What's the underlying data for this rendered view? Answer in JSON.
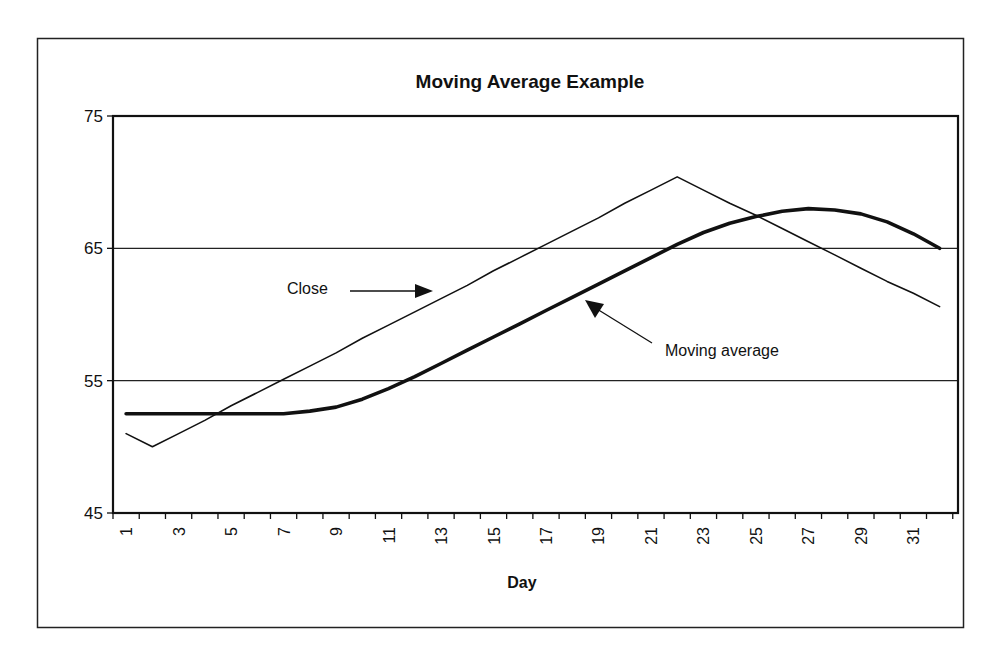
{
  "chart_data": {
    "type": "line",
    "title": "Moving Average Example",
    "xlabel": "Day",
    "ylabel": "",
    "ylim": [
      45,
      75
    ],
    "yticks": [
      45,
      55,
      65,
      75
    ],
    "xlim": [
      1,
      32
    ],
    "xtick_labels": [
      "1",
      "3",
      "5",
      "7",
      "9",
      "11",
      "13",
      "15",
      "17",
      "19",
      "21",
      "23",
      "25",
      "27",
      "29",
      "31"
    ],
    "grid": {
      "horizontal": true,
      "vertical": false,
      "lines_at": [
        55,
        65
      ]
    },
    "legend": null,
    "x": [
      1,
      2,
      3,
      4,
      5,
      6,
      7,
      8,
      9,
      10,
      11,
      12,
      13,
      14,
      15,
      16,
      17,
      18,
      19,
      20,
      21,
      22,
      23,
      24,
      25,
      26,
      27,
      28,
      29,
      30,
      31,
      32
    ],
    "series": [
      {
        "name": "Close",
        "style": "thin",
        "values": [
          51.0,
          50.0,
          51.0,
          52.0,
          53.1,
          54.1,
          55.1,
          56.1,
          57.1,
          58.2,
          59.2,
          60.2,
          61.2,
          62.2,
          63.3,
          64.3,
          65.3,
          66.3,
          67.3,
          68.4,
          69.4,
          70.4,
          69.4,
          68.4,
          67.5,
          66.5,
          65.5,
          64.5,
          63.5,
          62.5,
          61.6,
          60.6
        ]
      },
      {
        "name": "Moving average",
        "style": "thick",
        "values": [
          52.5,
          52.5,
          52.5,
          52.5,
          52.5,
          52.5,
          52.5,
          52.7,
          53.0,
          53.6,
          54.4,
          55.3,
          56.3,
          57.3,
          58.3,
          59.3,
          60.3,
          61.3,
          62.3,
          63.3,
          64.3,
          65.3,
          66.2,
          66.9,
          67.4,
          67.8,
          68.0,
          67.9,
          67.6,
          67.0,
          66.1,
          65.0
        ]
      }
    ],
    "annotations": [
      {
        "text": "Close",
        "arrow_to_series": "Close"
      },
      {
        "text": "Moving average",
        "arrow_to_series": "Moving average"
      }
    ]
  }
}
